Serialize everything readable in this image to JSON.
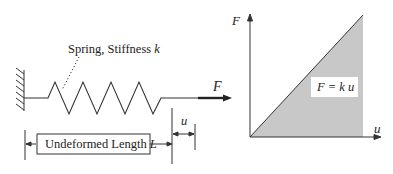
{
  "spring_diagram": {
    "spring_label": "Spring, Stiffness",
    "spring_symbol": "k",
    "force_label": "F",
    "length_label": "Undeformed Length",
    "length_symbol": "L",
    "displacement_label": "u"
  },
  "graph": {
    "y_axis_label": "F",
    "x_axis_label": "u",
    "equation": "F = k u",
    "fill_color": "#c8c8c8",
    "line_color": "#333333"
  }
}
